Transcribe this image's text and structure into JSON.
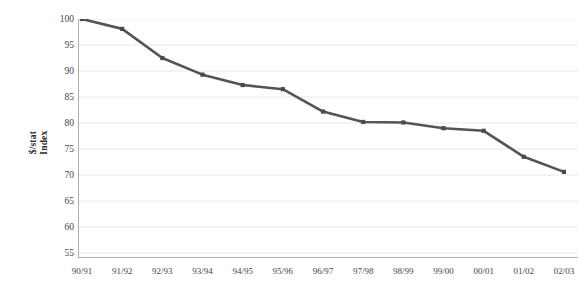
{
  "chart_data": {
    "type": "line",
    "title": "",
    "xlabel": "",
    "ylabel": "$/stat Index",
    "ylabel_line1": "$/stat",
    "ylabel_line2": "Index",
    "categories": [
      "90/91",
      "91/92",
      "92/93",
      "93/94",
      "94/95",
      "95/96",
      "96/97",
      "97/98",
      "98/99",
      "99/00",
      "00/01",
      "01/02",
      "02/03"
    ],
    "values": [
      100.0,
      98.1,
      92.5,
      89.3,
      87.3,
      86.5,
      82.2,
      80.2,
      80.1,
      79.0,
      78.5,
      73.5,
      70.6
    ],
    "series": [
      {
        "name": "$/stat Index",
        "values": [
          100.0,
          98.1,
          92.5,
          89.3,
          87.3,
          86.5,
          82.2,
          80.2,
          80.1,
          79.0,
          78.5,
          73.5,
          70.6
        ]
      }
    ],
    "ylim": [
      55,
      100
    ],
    "yticks": [
      100,
      95,
      90,
      85,
      80,
      75,
      70,
      65,
      60,
      55
    ],
    "ytick_labels": [
      "100",
      "95",
      "90",
      "85",
      "80",
      "75",
      "70",
      "65",
      "60",
      "55"
    ],
    "grid": true,
    "grid_axis": "y",
    "legend": false,
    "legend_position": "none",
    "marker": "square",
    "line_color": "#545454",
    "marker_color": "#4a4a4a",
    "grid_color": "#e8e8e8",
    "axis_color": "#aeaeae",
    "background_color": "#ffffff"
  }
}
